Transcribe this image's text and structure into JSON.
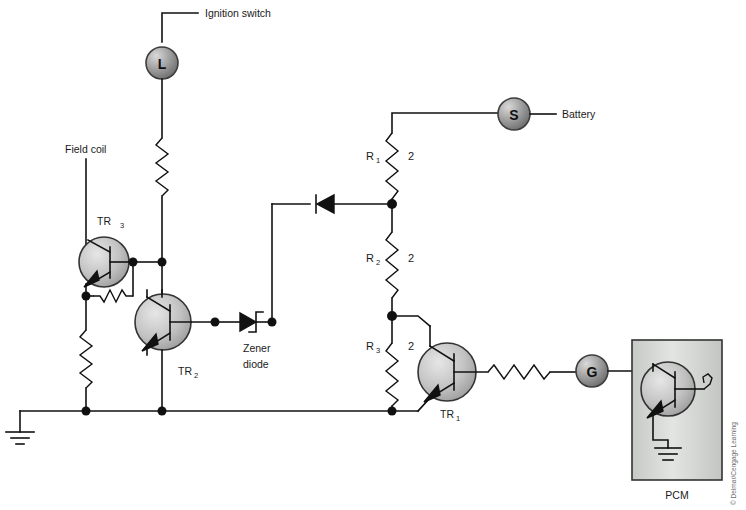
{
  "diagram": {
    "background_color": "#ffffff",
    "line_color": "#111111",
    "copyright": "© Delmar/Cengage Learning"
  },
  "labels": {
    "ignition_switch": "Ignition switch",
    "battery": "Battery",
    "field_coil": "Field coil",
    "zener_diode_line1": "Zener",
    "zener_diode_line2": "diode",
    "pcm": "PCM"
  },
  "terminals": [
    {
      "id": "L",
      "label": "L",
      "x": 162,
      "y": 63,
      "connects": "ignition-switch"
    },
    {
      "id": "S",
      "label": "S",
      "x": 514,
      "y": 114,
      "connects": "battery"
    },
    {
      "id": "G",
      "label": "G",
      "x": 592,
      "y": 371,
      "connects": "pcm"
    }
  ],
  "transistors": [
    {
      "id": "TR3",
      "label": "TR",
      "sub": "3",
      "x": 104,
      "y": 262
    },
    {
      "id": "TR2",
      "label": "TR",
      "sub": "2",
      "x": 163,
      "y": 322
    },
    {
      "id": "TR1",
      "label": "TR",
      "sub": "1",
      "x": 447,
      "y": 372
    },
    {
      "id": "TRP",
      "label": "",
      "sub": "",
      "x": 668,
      "y": 389
    }
  ],
  "resistors": [
    {
      "id": "R1",
      "label": "R",
      "sub": "1",
      "value": "2",
      "orientation": "vertical"
    },
    {
      "id": "R2",
      "label": "R",
      "sub": "2",
      "value": "2",
      "orientation": "vertical"
    },
    {
      "id": "R3",
      "label": "R",
      "sub": "3",
      "value": "2",
      "orientation": "vertical"
    },
    {
      "id": "R-lamp",
      "label": "",
      "sub": "",
      "value": "",
      "orientation": "vertical"
    },
    {
      "id": "R-field",
      "label": "",
      "sub": "",
      "value": "",
      "orientation": "vertical"
    },
    {
      "id": "R-tr3-base",
      "label": "",
      "sub": "",
      "value": "",
      "orientation": "horizontal"
    },
    {
      "id": "R-base-tr1",
      "label": "",
      "sub": "",
      "value": "",
      "orientation": "horizontal"
    }
  ],
  "diodes": [
    {
      "id": "D1",
      "type": "diode",
      "direction": "left"
    },
    {
      "id": "DZ",
      "type": "zener",
      "direction": "right"
    }
  ],
  "symbols": [
    {
      "id": "ground-main",
      "type": "ground",
      "x": 20,
      "y": 418
    },
    {
      "id": "ground-pcm",
      "type": "ground",
      "x": 668,
      "y": 430
    }
  ]
}
